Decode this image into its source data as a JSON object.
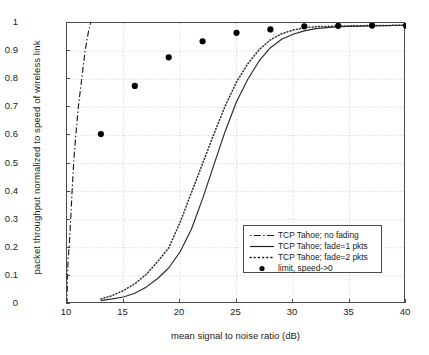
{
  "chart_data": {
    "type": "line",
    "title": "",
    "xlabel": "mean signal to noise ratio (dB)",
    "ylabel": "packet throughput normalized to speed of wireless link",
    "xlim": [
      10,
      40
    ],
    "ylim": [
      0,
      1
    ],
    "xticks": [
      "10",
      "15",
      "20",
      "25",
      "30",
      "35",
      "40"
    ],
    "yticks": [
      "0",
      "0.1",
      "0.2",
      "0.3",
      "0.4",
      "0.5",
      "0.6",
      "0.7",
      "0.8",
      "0.9",
      "1"
    ],
    "grid": true,
    "legend_position": "lower right",
    "series": [
      {
        "name": "TCP Tahoe; no fading",
        "style": "dash-dot",
        "color": "#1a1a1a",
        "points": [
          [
            10.0,
            0.0
          ],
          [
            10.05,
            0.11
          ],
          [
            10.1,
            0.16
          ],
          [
            10.2,
            0.21
          ],
          [
            10.3,
            0.28
          ],
          [
            10.45,
            0.4
          ],
          [
            10.6,
            0.51
          ],
          [
            10.8,
            0.61
          ],
          [
            11.0,
            0.7
          ],
          [
            11.3,
            0.8
          ],
          [
            11.6,
            0.9
          ],
          [
            11.9,
            0.97
          ],
          [
            12.1,
            1.0
          ]
        ]
      },
      {
        "name": "TCP Tahoe; fade=1 pkts",
        "style": "solid",
        "color": "#2b2b2b",
        "points": [
          [
            13.0,
            0.012
          ],
          [
            14.0,
            0.018
          ],
          [
            15.0,
            0.025
          ],
          [
            16.0,
            0.038
          ],
          [
            17.0,
            0.06
          ],
          [
            18.0,
            0.09
          ],
          [
            19.0,
            0.128
          ],
          [
            20.0,
            0.185
          ],
          [
            21.0,
            0.265
          ],
          [
            22.0,
            0.375
          ],
          [
            23.0,
            0.495
          ],
          [
            24.0,
            0.615
          ],
          [
            25.0,
            0.72
          ],
          [
            26.0,
            0.8
          ],
          [
            27.0,
            0.865
          ],
          [
            28.0,
            0.912
          ],
          [
            29.0,
            0.942
          ],
          [
            30.0,
            0.96
          ],
          [
            31.0,
            0.972
          ],
          [
            32.0,
            0.98
          ],
          [
            34.0,
            0.987
          ],
          [
            37.0,
            0.99
          ],
          [
            40.0,
            0.992
          ]
        ]
      },
      {
        "name": "TCP Tahoe; fade=2 pkts",
        "style": "dotted",
        "color": "#2b2b2b",
        "points": [
          [
            13.0,
            0.018
          ],
          [
            14.0,
            0.03
          ],
          [
            15.0,
            0.048
          ],
          [
            16.0,
            0.072
          ],
          [
            17.0,
            0.105
          ],
          [
            18.0,
            0.15
          ],
          [
            19.0,
            0.2
          ],
          [
            20.0,
            0.29
          ],
          [
            21.0,
            0.395
          ],
          [
            22.0,
            0.5
          ],
          [
            23.0,
            0.605
          ],
          [
            24.0,
            0.705
          ],
          [
            25.0,
            0.79
          ],
          [
            26.0,
            0.855
          ],
          [
            27.0,
            0.905
          ],
          [
            28.0,
            0.94
          ],
          [
            29.0,
            0.962
          ],
          [
            30.0,
            0.975
          ],
          [
            31.0,
            0.983
          ],
          [
            32.0,
            0.987
          ],
          [
            34.0,
            0.989
          ],
          [
            37.0,
            0.991
          ],
          [
            40.0,
            0.992
          ]
        ]
      }
    ],
    "markers": {
      "name": "limit, speed->0",
      "style": "filled-circle",
      "color": "#000000",
      "points": [
        [
          13.0,
          0.605
        ],
        [
          16.0,
          0.776
        ],
        [
          19.0,
          0.878
        ],
        [
          22.0,
          0.935
        ],
        [
          25.0,
          0.965
        ],
        [
          28.0,
          0.977
        ],
        [
          31.0,
          0.988
        ],
        [
          34.0,
          0.99
        ],
        [
          37.0,
          0.991
        ],
        [
          40.0,
          0.991
        ]
      ]
    }
  },
  "legend": {
    "entries": [
      {
        "label": "TCP Tahoe; no fading",
        "style": "dash-dot"
      },
      {
        "label": "TCP Tahoe; fade=1 pkts",
        "style": "solid"
      },
      {
        "label": "TCP Tahoe; fade=2 pkts",
        "style": "dotted"
      },
      {
        "label": "limit, speed->0",
        "style": "marker"
      }
    ]
  }
}
